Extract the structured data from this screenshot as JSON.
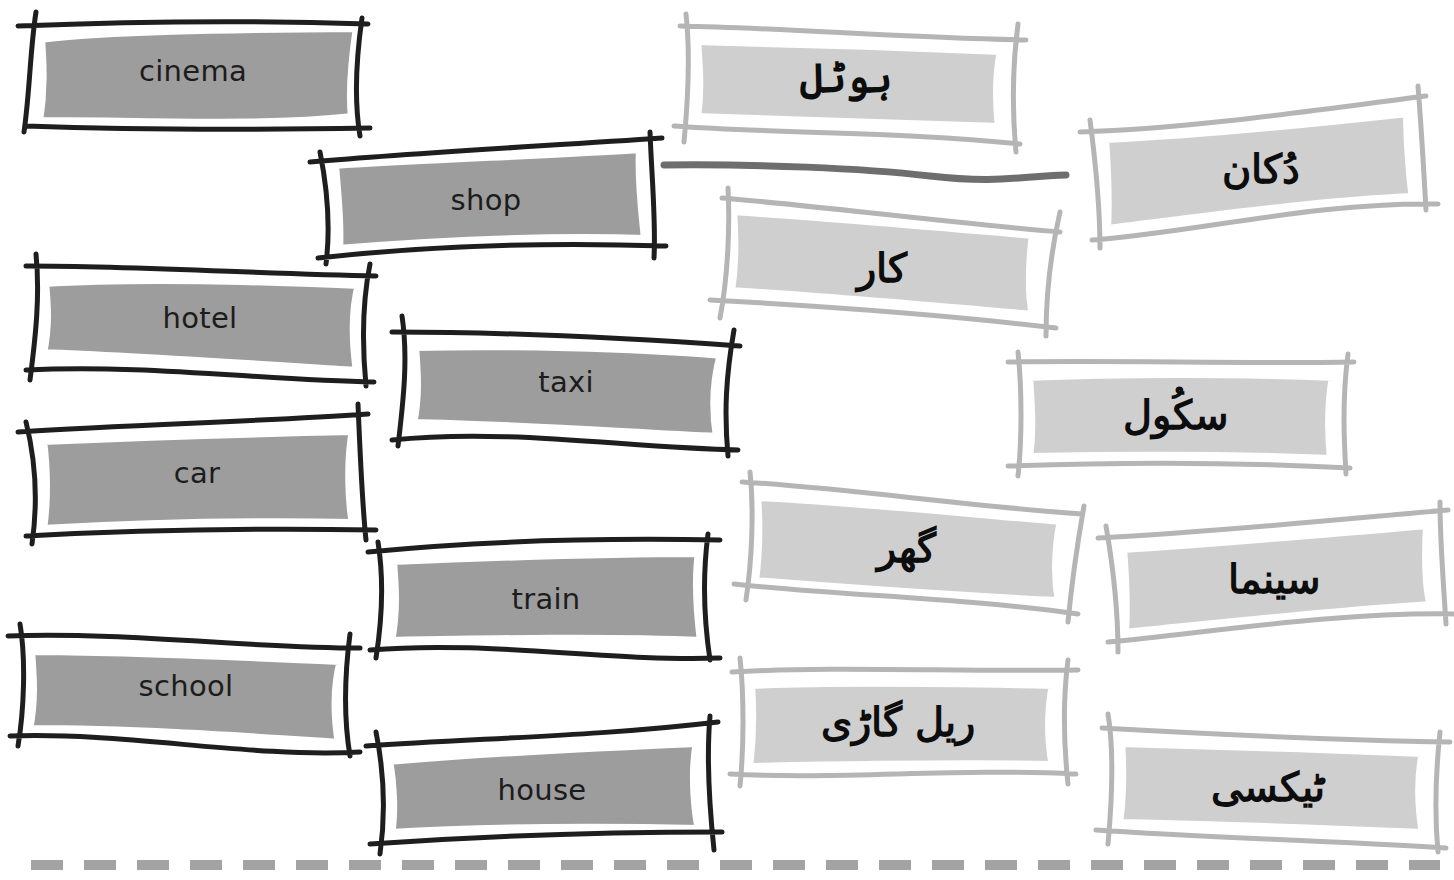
{
  "exercise": {
    "type": "matching",
    "colors": {
      "english_frame": "#1e1e1e",
      "english_fill": "#9d9d9d",
      "urdu_frame": "#b5b5b5",
      "urdu_fill": "#cfcfcf",
      "inner_border": "#ffffff",
      "connector_line": "#6e6e6e",
      "dashed_rule": "#a3a3a3"
    },
    "english_words": [
      {
        "id": "cinema",
        "label": "cinema"
      },
      {
        "id": "shop",
        "label": "shop"
      },
      {
        "id": "hotel",
        "label": "hotel"
      },
      {
        "id": "taxi",
        "label": "taxi"
      },
      {
        "id": "car",
        "label": "car"
      },
      {
        "id": "train",
        "label": "train"
      },
      {
        "id": "school",
        "label": "school"
      },
      {
        "id": "house",
        "label": "house"
      }
    ],
    "urdu_words": [
      {
        "id": "hotel_ur",
        "label": "ہوٹل"
      },
      {
        "id": "dukaan_ur",
        "label": "دُکان"
      },
      {
        "id": "car_ur",
        "label": "کار"
      },
      {
        "id": "school_ur",
        "label": "سکُول"
      },
      {
        "id": "ghar_ur",
        "label": "گھر"
      },
      {
        "id": "cinema_ur",
        "label": "سینما"
      },
      {
        "id": "railgari_ur",
        "label": "ریل گاڑی"
      },
      {
        "id": "taxi_ur",
        "label": "ٹیکسی"
      }
    ],
    "example_match": {
      "from": "shop",
      "to": "dukaan_ur"
    }
  }
}
